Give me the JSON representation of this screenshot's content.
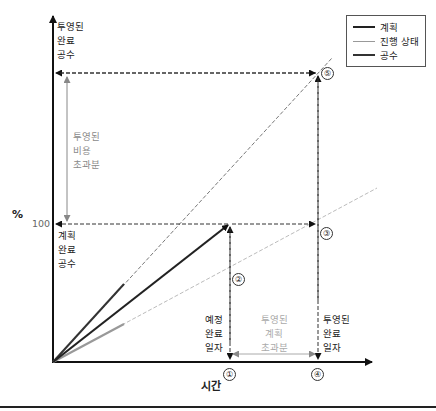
{
  "legend": {
    "items": [
      {
        "label": "계획",
        "color": "#222222",
        "style": "solid-thick"
      },
      {
        "label": "진행 상태",
        "color": "#999999",
        "style": "solid-thin"
      },
      {
        "label": "공수",
        "color": "#333333",
        "style": "solid-medium"
      }
    ]
  },
  "axes": {
    "y_label": "%",
    "y_tick": "100",
    "x_label": "시간"
  },
  "labels": {
    "projected_completion_effort": [
      "투영된",
      "완료",
      "공수"
    ],
    "planned_completion_effort": [
      "계획",
      "완료",
      "공수"
    ],
    "projected_cost_overrun": [
      "투영된",
      "비용",
      "초과분"
    ],
    "scheduled_completion_date": [
      "예정",
      "완료",
      "일자"
    ],
    "projected_schedule_overrun": [
      "투영된",
      "계획",
      "초과분"
    ],
    "projected_completion_date": [
      "투영된",
      "완료",
      "일자"
    ]
  },
  "markers": {
    "m1": "①",
    "m2": "②",
    "m3": "③",
    "m4": "④",
    "m5": "⑤"
  },
  "colors": {
    "plan": "#222222",
    "progress": "#999999",
    "effort": "#333333",
    "dashed": "#333333",
    "annotation": "#8a8a8a"
  }
}
